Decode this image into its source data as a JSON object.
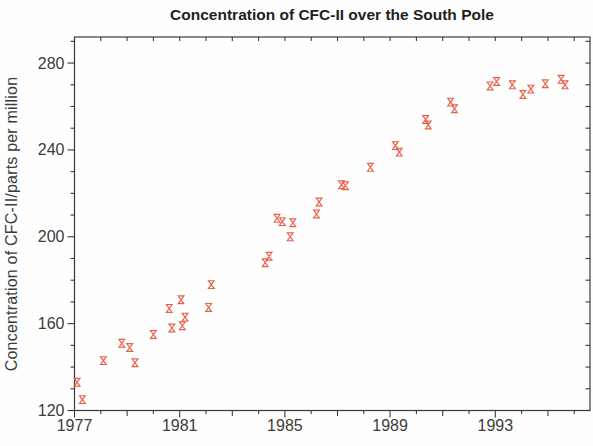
{
  "title": "Concentration of CFC-II over the South Pole",
  "colors": {
    "marker": "#e8604a",
    "axis": "#3a3a3a",
    "title_text": "#1f1f1f",
    "tick_label_text": "#3c3c3c",
    "background": "#fefefe"
  },
  "chart_data": {
    "type": "scatter",
    "title": "Concentration of CFC-II over the South Pole",
    "xlabel": "",
    "ylabel": "Concentration of CFC-II/parts per million",
    "xlim": [
      1977,
      1996.6
    ],
    "ylim": [
      120,
      292
    ],
    "x_major_ticks": [
      1977,
      1981,
      1985,
      1989,
      1993
    ],
    "x_medium_ticks": [
      1979,
      1983,
      1987,
      1991,
      1995
    ],
    "x_minor_step": 1,
    "y_major_ticks": [
      120,
      160,
      200,
      240,
      280
    ],
    "y_minor_step": 10,
    "grid": false,
    "legend": null,
    "marker_shape": "hourglass",
    "points": [
      [
        1977.1,
        133
      ],
      [
        1977.3,
        125
      ],
      [
        1978.1,
        143
      ],
      [
        1978.8,
        151
      ],
      [
        1979.1,
        149
      ],
      [
        1979.3,
        142
      ],
      [
        1980.0,
        155
      ],
      [
        1980.6,
        167
      ],
      [
        1980.7,
        158
      ],
      [
        1981.05,
        171
      ],
      [
        1981.1,
        159
      ],
      [
        1981.2,
        163
      ],
      [
        1982.1,
        167.5
      ],
      [
        1982.2,
        178
      ],
      [
        1984.25,
        188
      ],
      [
        1984.4,
        191
      ],
      [
        1984.7,
        208.5
      ],
      [
        1984.9,
        207
      ],
      [
        1985.2,
        200
      ],
      [
        1985.3,
        206.5
      ],
      [
        1986.2,
        210.5
      ],
      [
        1986.3,
        216
      ],
      [
        1987.15,
        224
      ],
      [
        1987.3,
        223.5
      ],
      [
        1988.25,
        232
      ],
      [
        1989.2,
        242
      ],
      [
        1989.35,
        239
      ],
      [
        1990.35,
        254
      ],
      [
        1990.45,
        251.5
      ],
      [
        1991.3,
        262
      ],
      [
        1991.45,
        259
      ],
      [
        1992.8,
        269.5
      ],
      [
        1993.05,
        271.5
      ],
      [
        1993.65,
        270
      ],
      [
        1994.05,
        265.5
      ],
      [
        1994.35,
        268
      ],
      [
        1994.9,
        270.5
      ],
      [
        1995.5,
        272.5
      ],
      [
        1995.65,
        270
      ]
    ]
  }
}
